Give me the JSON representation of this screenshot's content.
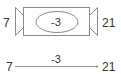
{
  "diagram": {
    "top": {
      "left_label": "7",
      "center_label": "-3",
      "right_label": "21"
    },
    "bottom": {
      "left_label": "7",
      "center_label": "-3",
      "right_label": "21"
    },
    "colors": {
      "stroke": "#888888",
      "text": "#333333",
      "background": "#ffffff"
    }
  }
}
